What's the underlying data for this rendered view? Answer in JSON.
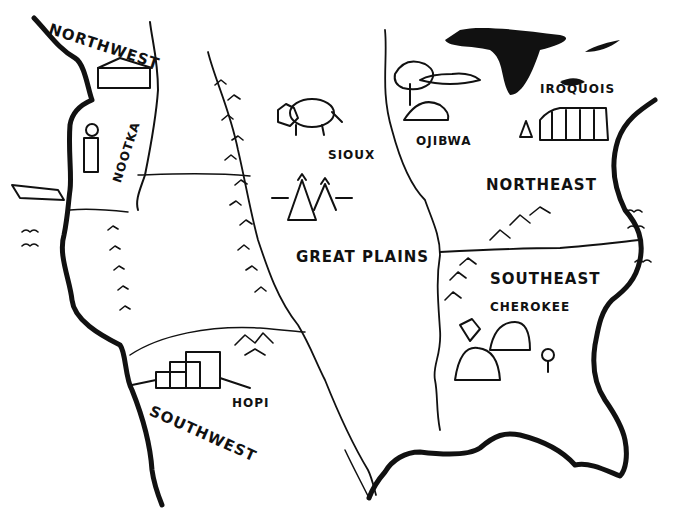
{
  "map": {
    "regions": [
      {
        "id": "northwest",
        "label": "NORTHWEST"
      },
      {
        "id": "great-plains",
        "label": "GREAT PLAINS"
      },
      {
        "id": "northeast",
        "label": "NORTHEAST"
      },
      {
        "id": "southeast",
        "label": "SOUTHEAST"
      },
      {
        "id": "southwest",
        "label": "SOUTHWEST"
      }
    ],
    "tribes": [
      {
        "id": "nootka",
        "label": "NOOTKA"
      },
      {
        "id": "sioux",
        "label": "SIOUX"
      },
      {
        "id": "ojibwa",
        "label": "OJIBWA"
      },
      {
        "id": "iroquois",
        "label": "IROQUOIS"
      },
      {
        "id": "cherokee",
        "label": "CHEROKEE"
      },
      {
        "id": "hopi",
        "label": "HOPI"
      }
    ],
    "colors": {
      "ink": "#111111",
      "paper": "#ffffff"
    }
  }
}
